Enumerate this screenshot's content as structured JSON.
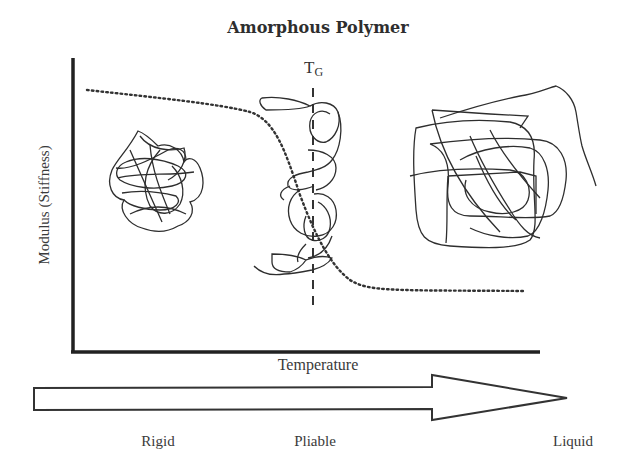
{
  "diagram": {
    "title": "Amorphous Polymer",
    "y_axis_label": "Modulus (Stiffness)",
    "x_axis_label": "Temperature",
    "transition_marker": {
      "label": "T",
      "subscript": "G"
    },
    "progression_arrow": {
      "direction": "left-to-right",
      "stages": [
        "Rigid",
        "Pliable",
        "Liquid"
      ]
    },
    "elements": [
      {
        "name": "modulus-curve",
        "style": "dotted",
        "description": "High plateau, steep drop at TG, low plateau"
      },
      {
        "name": "glass-transition-line",
        "style": "dashed",
        "description": "Vertical line at TG"
      },
      {
        "name": "tight-chain-coil",
        "description": "Compact tangled polymer chain (rigid state)"
      },
      {
        "name": "stretched-chain-coil",
        "description": "Partially uncoiled chain along TG line (pliable state)"
      },
      {
        "name": "loose-chain-coil",
        "description": "Large loose tangled chain (liquid state)"
      }
    ],
    "colors": {
      "line": "#2a2a2a",
      "text": "#333333",
      "background": "#ffffff"
    }
  }
}
